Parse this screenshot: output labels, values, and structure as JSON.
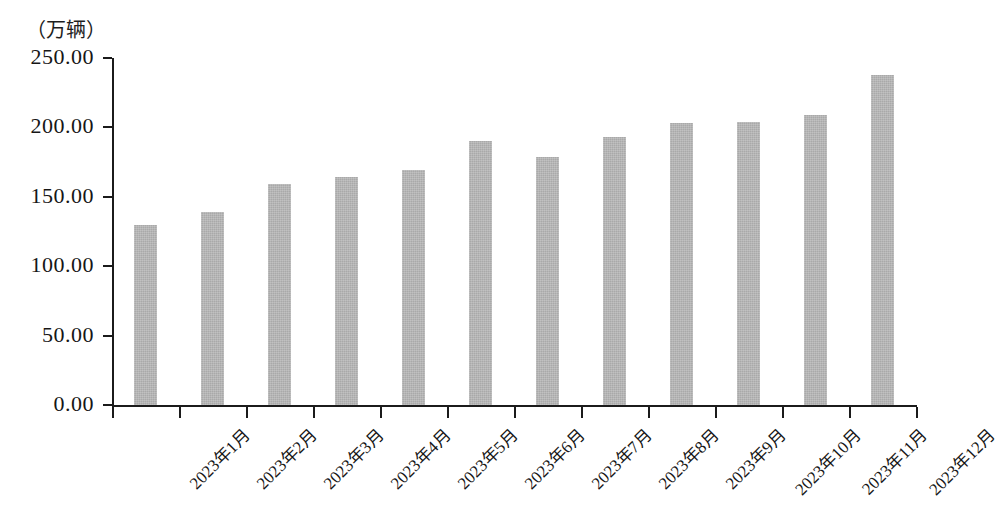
{
  "chart_data": {
    "type": "bar",
    "title": "",
    "subtitle": "",
    "unit_caption": "（万辆）",
    "xlabel": "",
    "ylabel": "",
    "ylim": [
      0,
      250
    ],
    "ytick_values": [
      0,
      50,
      100,
      150,
      200,
      250
    ],
    "ytick_labels": [
      "0.00",
      "50.00",
      "100.00",
      "150.00",
      "200.00",
      "250.00"
    ],
    "grid": false,
    "legend": null,
    "categories": [
      "2023年1月",
      "2023年2月",
      "2023年3月",
      "2023年4月",
      "2023年5月",
      "2023年6月",
      "2023年7月",
      "2023年8月",
      "2023年9月",
      "2023年10月",
      "2023年11月",
      "2023年12月"
    ],
    "values": [
      130,
      139,
      159,
      164,
      169,
      190,
      179,
      193,
      203,
      204,
      209,
      238
    ],
    "bar_color": "#a9a9a9",
    "axis_color": "#1b1b1b",
    "text_color": "#161616"
  }
}
